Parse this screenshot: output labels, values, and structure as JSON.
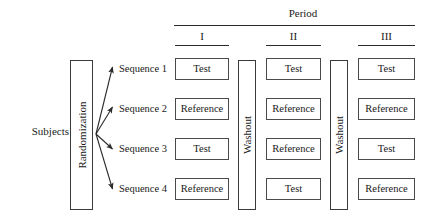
{
  "header": {
    "group_title": "Period",
    "periods": [
      "I",
      "II",
      "III"
    ]
  },
  "left": {
    "subjects_label": "Subjects→",
    "randomization_label": "Randomization"
  },
  "washouts": [
    {
      "label": "Washout"
    },
    {
      "label": "Washout"
    }
  ],
  "sequences": [
    {
      "label": "Sequence 1",
      "treatments": [
        "Test",
        "Test",
        "Test"
      ]
    },
    {
      "label": "Sequence 2",
      "treatments": [
        "Reference",
        "Reference",
        "Reference"
      ]
    },
    {
      "label": "Sequence 3",
      "treatments": [
        "Test",
        "Reference",
        "Test"
      ]
    },
    {
      "label": "Sequence 4",
      "treatments": [
        "Reference",
        "Test",
        "Reference"
      ]
    }
  ],
  "colors": {
    "background": "#ffffff",
    "text": "#1a1a1a",
    "box_border": "#4a4a4a",
    "rule": "#2a2a2a",
    "arrow": "#2b2b2b"
  }
}
